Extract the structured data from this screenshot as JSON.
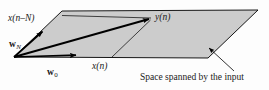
{
  "figure": {
    "name": "space-spanned-by-input-diagram",
    "background_color": "#fdfdfd",
    "plane_fill_color": "#cccccc",
    "stroke_color": "#000000",
    "text_color": "#1a1a1a"
  },
  "labels": {
    "input_delayed": {
      "base": "x",
      "arg": "(n–N)"
    },
    "weight_N": {
      "symbol": "w",
      "subscript": "N"
    },
    "weight_0": {
      "symbol": "w",
      "subscript": "0"
    },
    "input_current": {
      "base": "x",
      "arg": "(n)"
    },
    "output": {
      "base": "y",
      "arg": "(n)"
    },
    "caption": "Space spanned by the input"
  },
  "geometry": {
    "plane_polygon": "62,11 258,10 208,58 14,57",
    "origin": [
      14,
      57
    ],
    "vectors": [
      {
        "name": "w_N",
        "from": [
          14,
          57
        ],
        "to": [
          44,
          30
        ]
      },
      {
        "name": "w_0",
        "from": [
          14,
          57
        ],
        "to": [
          79,
          55
        ]
      },
      {
        "name": "y_n",
        "from": [
          14,
          57
        ],
        "to": [
          152,
          18
        ]
      }
    ],
    "guide_lines": [
      {
        "name": "top-horizontal-guide",
        "from": [
          62,
          15
        ],
        "to": [
          152,
          18
        ]
      },
      {
        "name": "projection-guide",
        "from": [
          150,
          20
        ],
        "to": [
          112,
          57
        ]
      }
    ],
    "caption_pointer": {
      "from": [
        234,
        71
      ],
      "to": [
        207,
        46
      ]
    }
  }
}
